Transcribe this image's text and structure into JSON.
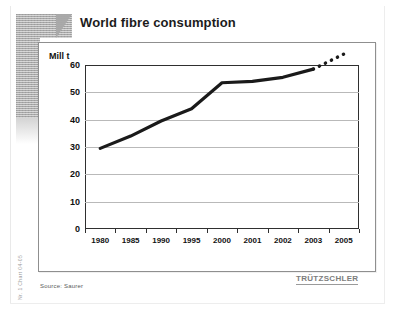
{
  "slide": {
    "title": "World fibre consumption",
    "source_note": "Source: Saurer",
    "brand_logo": "TRÜTZSCHLER",
    "side_code": "Nr. 1 Chart 04-05"
  },
  "chart_data": {
    "type": "line",
    "title": "World fibre consumption",
    "xlabel": "",
    "ylabel": "Mill t",
    "ylim": [
      0,
      60
    ],
    "xlim": [
      1980,
      2005
    ],
    "grid": true,
    "legend": "none",
    "y_unit_caption": "Mill t",
    "ytick_labels": [
      "0",
      "10",
      "20",
      "30",
      "40",
      "50",
      "60"
    ],
    "ytick_values": [
      0,
      10,
      20,
      30,
      40,
      50,
      60
    ],
    "xtick_labels": [
      "1980",
      "1985",
      "1990",
      "1995",
      "2000",
      "2001",
      "2002",
      "2003",
      "2005"
    ],
    "x": [
      1980,
      1985,
      1990,
      1995,
      2000,
      2001,
      2002,
      2003,
      2005
    ],
    "series": [
      {
        "name": "World fibre consumption (actual)",
        "style": "solid",
        "x": [
          1980,
          1985,
          1990,
          1995,
          2000,
          2001,
          2002,
          2003
        ],
        "values": [
          29.5,
          34.0,
          39.5,
          44.0,
          53.5,
          54.0,
          55.5,
          58.5
        ]
      },
      {
        "name": "World fibre consumption (forecast)",
        "style": "dotted",
        "x": [
          2003,
          2005
        ],
        "values": [
          58.5,
          64.0
        ]
      }
    ]
  },
  "colors": {
    "line": "#1a1a1a",
    "grid": "#b9b9b9",
    "frame": "#2f2f2f",
    "deco": "#a8a8a8",
    "logo": "#7d7d7d"
  }
}
